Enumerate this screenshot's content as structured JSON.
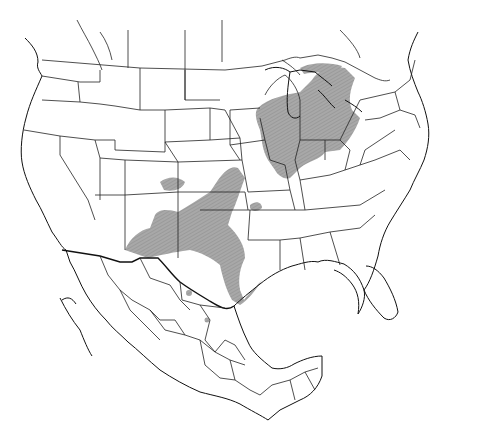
{
  "map": {
    "title": "Species range map of North America",
    "region": "United States and Mexico",
    "style": "line-art outline map with hatched gray range shading",
    "colors": {
      "background": "#ffffff",
      "borders": "#222222",
      "range_fill": "#a8a8a8",
      "range_hatch": "#8c8c8c"
    },
    "range_areas": [
      "Great Lakes region (Michigan, Indiana, Illinois, Ohio, southern Ontario)",
      "Iowa / Missouri",
      "Kansas / Oklahoma",
      "Texas (central and Gulf coast)",
      "New Mexico / southeastern Arizona",
      "Nuevo León / Coahuila (isolated spots)"
    ],
    "labels": []
  }
}
